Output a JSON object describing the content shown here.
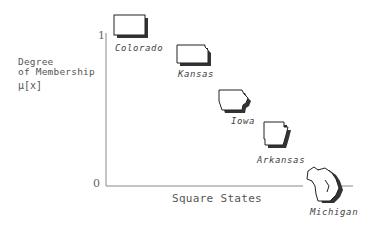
{
  "diagram": {
    "title": "",
    "y_axis": {
      "label_line1": "Degree",
      "label_line2": "of Membership",
      "symbol": "μ[x]",
      "tick_top": "1",
      "tick_bottom": "0"
    },
    "x_axis": {
      "label": "Square States"
    },
    "states": [
      {
        "name": "Colorado",
        "membership": 1.0
      },
      {
        "name": "Kansas",
        "membership": 0.85
      },
      {
        "name": "Iowa",
        "membership": 0.6
      },
      {
        "name": "Arkansas",
        "membership": 0.4
      },
      {
        "name": "Michigan",
        "membership": 0.0
      }
    ],
    "colors": {
      "axis": "#888888",
      "outline": "#222222",
      "shadow": "#333333",
      "text": "#555555"
    }
  }
}
